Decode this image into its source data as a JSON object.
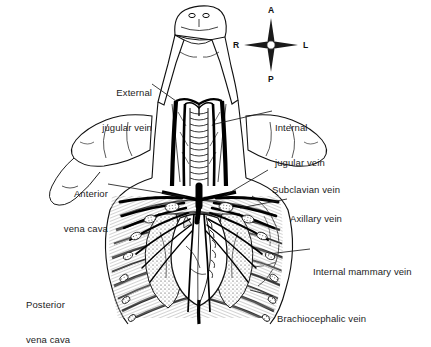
{
  "figure": {
    "kind": "anatomical-line-drawing",
    "view": "ventral",
    "background_color": "#ffffff",
    "ink_color": "#111111",
    "text_color": "#1c1c1c"
  },
  "labels": [
    {
      "id": "external-jugular-vein",
      "line1": "External",
      "line2": "jugular vein",
      "side": "left",
      "x": 70,
      "y": 64,
      "leader": "M 152 84 L 176 101"
    },
    {
      "id": "internal-jugular-vein",
      "line1": "Internal",
      "line2": "jugular vein",
      "side": "right",
      "x": 275,
      "y": 99,
      "leader": "M 272 111 L 215 124"
    },
    {
      "id": "anterior-vena-cava",
      "line1": "Anterior",
      "line2": "vena cava",
      "side": "left",
      "x": 22,
      "y": 165,
      "leader": "M 108 184 L 186 197"
    },
    {
      "id": "subclavian-vein",
      "line1": "Subclavian vein",
      "line2": "",
      "side": "right",
      "x": 272,
      "y": 161,
      "leader": "M 268 170 L 224 196"
    },
    {
      "id": "axillary-vein",
      "line1": "Axillary vein",
      "line2": "",
      "side": "right",
      "x": 290,
      "y": 190,
      "leader": "M 287 199 L 240 208"
    },
    {
      "id": "internal-mammary-vein",
      "line1": "Internal mammary vein",
      "line2": "",
      "side": "right",
      "x": 313,
      "y": 243,
      "leader": "M 310 249 L 268 254"
    },
    {
      "id": "brachiocephalic-vein",
      "line1": "Brachiocephalic vein",
      "line2": "",
      "side": "right",
      "x": 277,
      "y": 290,
      "leader": "M 273 296 L 250 290"
    },
    {
      "id": "posterior-vena-cava",
      "line1": "Posterior",
      "line2": "vena cava",
      "side": "left",
      "x": 26,
      "y": 276,
      "leader": ""
    }
  ],
  "compass": {
    "id": "orientation-compass",
    "center_x": 271,
    "center_y": 45,
    "anterior": "A",
    "right": "R",
    "left": "L",
    "posterior": "P"
  }
}
